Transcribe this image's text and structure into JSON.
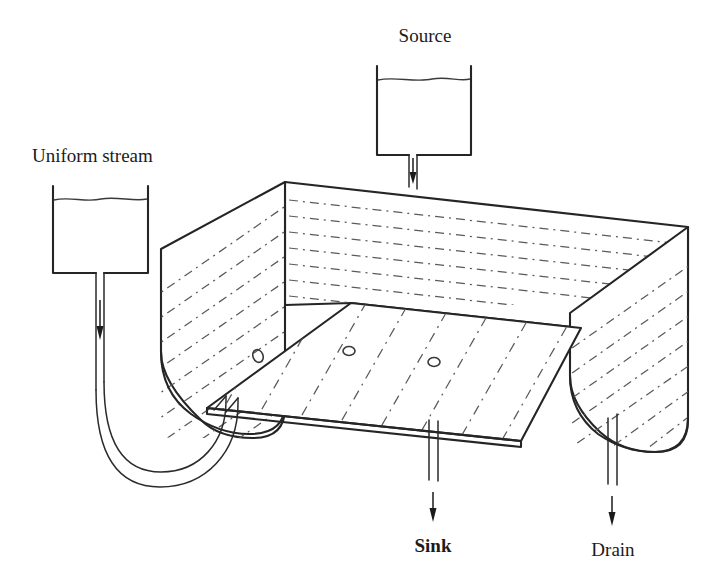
{
  "diagram": {
    "background_color": "#ffffff",
    "line_color": "#252525",
    "hatch_color": "#5a5a5a",
    "labels": {
      "source": "Source",
      "uniform_stream": "Uniform stream",
      "sink": "Sink",
      "drain": "Drain"
    },
    "reservoirs": [
      {
        "name": "source-reservoir",
        "label": "Source",
        "label_position": "above",
        "has_liquid_level_line": true,
        "outlet_direction": "down"
      },
      {
        "name": "uniform-stream-reservoir",
        "label": "Uniform stream",
        "label_position": "above",
        "has_liquid_level_line": true,
        "outlet_direction": "down"
      }
    ],
    "outlets": [
      {
        "name": "sink-outlet",
        "label": "Sink",
        "label_position": "below",
        "flow_direction": "down"
      },
      {
        "name": "drain-outlet",
        "label": "Drain",
        "label_position": "below",
        "flow_direction": "down"
      }
    ],
    "tank": {
      "name": "water-table-tank",
      "walls": [
        "left-wall",
        "back-wall",
        "right-wall"
      ],
      "floor": "floor-plate",
      "floor_holes": 3,
      "hatching": {
        "back_wall": "horizontal dash-dot",
        "left_wall": "diagonal dash-dot",
        "right_wall": "diagonal dash-dot",
        "floor": "diagonal dash-dot"
      }
    },
    "piping": {
      "name": "u-bend-pipe",
      "description": "U-bend tube from uniform stream reservoir to tank floor inlet",
      "style": "double-line tube"
    },
    "flow_arrows": [
      {
        "name": "source-flow-arrow",
        "direction": "down"
      },
      {
        "name": "uniform-stream-flow-arrow",
        "direction": "down"
      },
      {
        "name": "sink-flow-arrow",
        "direction": "down"
      },
      {
        "name": "drain-flow-arrow",
        "direction": "down"
      }
    ]
  }
}
